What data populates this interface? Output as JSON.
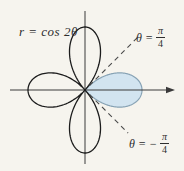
{
  "figure": {
    "background": "#f6f4ee",
    "equation_label": "r = cos 2θ",
    "ray_labels": {
      "upper": {
        "prefix": "θ =",
        "numerator": "π",
        "denominator": "4"
      },
      "lower": {
        "prefix": "θ = −",
        "numerator": "π",
        "denominator": "4"
      }
    }
  },
  "chart_data": {
    "type": "line",
    "coordinate_system": "polar",
    "equation": "r = cos 2θ",
    "r_function": "cos(2*theta)",
    "theta_domain_rad": [
      0,
      6.2832
    ],
    "max_r": 1,
    "petal_count": 4,
    "petal_directions_deg": [
      0,
      90,
      180,
      270
    ],
    "curve_color": "#1c1c1c",
    "axes": {
      "x_axis_visible": true,
      "y_axis_visible": true,
      "arrow_on_positive_x": true,
      "color": "#3a3a3a"
    },
    "shaded_region": {
      "description": "right petal of the rose, bounded by r = cos 2θ for −π/4 ≤ θ ≤ π/4",
      "theta_from_label": "−π/4",
      "theta_to_label": "π/4",
      "theta_from_rad": -0.7854,
      "theta_to_rad": 0.7854,
      "fill": "#d2e4f0",
      "stroke": "#87a2b4"
    },
    "rays": [
      {
        "label": "θ = π/4",
        "angle_rad": 0.7854,
        "style": "dashed",
        "color": "#4a4a4a"
      },
      {
        "label": "θ = −π/4",
        "angle_rad": -0.7854,
        "style": "dashed",
        "color": "#4a4a4a"
      }
    ],
    "grid": false,
    "legend": "none"
  }
}
